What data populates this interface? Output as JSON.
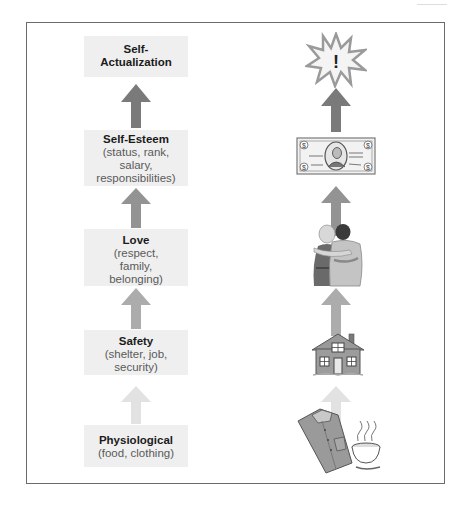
{
  "diagram": {
    "levels": [
      {
        "title": "Self-\nActualization",
        "title_line1": "Self-",
        "title_line2": "Actualization",
        "description": "",
        "icon": "starburst-exclamation-icon"
      },
      {
        "title": "Self-Esteem",
        "description_lines": [
          "(status, rank,",
          "salary,",
          "responsibilities)"
        ],
        "icon": "dollar-bill-icon"
      },
      {
        "title": "Love",
        "description_lines": [
          "(respect,",
          "family,",
          "belonging)"
        ],
        "icon": "embracing-couple-icon"
      },
      {
        "title": "Safety",
        "description_lines": [
          "(shelter, job,",
          "security)"
        ],
        "icon": "house-icon"
      },
      {
        "title": "Physiological",
        "description_lines": [
          "(food, clothing)"
        ],
        "icon": "shirt-and-soup-icon"
      }
    ],
    "arrow_colors": [
      "#7a7a7a",
      "#939393",
      "#acacac",
      "#c6c6c6",
      "#e2e2e2"
    ],
    "icon_symbols": {
      "starburst_mark": "!",
      "bill_mark": "$"
    }
  }
}
